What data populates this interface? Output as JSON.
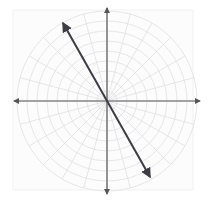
{
  "figure": {
    "width": 208,
    "height": 202,
    "background_color": "#ffffff"
  },
  "chart_data": {
    "type": "scatter",
    "title": "",
    "subtitle": "",
    "xlabel": "",
    "ylabel": "",
    "coordinate_system": "polar",
    "grid": true,
    "legend": false,
    "legend_position": "none",
    "origin": {
      "x": 107,
      "y": 101
    },
    "panel": {
      "x": 13,
      "y": 10,
      "width": 180,
      "height": 180,
      "fill_color": "#fcfcfc",
      "border_color": "#f2f2f2"
    },
    "polar_grid": {
      "circle_color": "#e3e3e6",
      "spoke_color": "#e3e3e6",
      "circle_radii": [
        10,
        20,
        30,
        40,
        50,
        60,
        70,
        80,
        90
      ],
      "radial_spoke_step_degrees": 15,
      "radial_spoke_count": 24,
      "max_radius": 90
    },
    "axes": {
      "color": "#555555",
      "stroke_width": 1.2,
      "x_axis": {
        "x1": 14,
        "y1": 101,
        "x2": 200,
        "y2": 101,
        "arrow_both_ends": true
      },
      "y_axis": {
        "x1": 107,
        "y1": 8,
        "x2": 107,
        "y2": 194,
        "arrow_both_ends": true
      },
      "xlim": [
        -93,
        93
      ],
      "ylim": [
        -93,
        93
      ],
      "tick_labels_x": [],
      "tick_labels_y": []
    },
    "series": [
      {
        "name": "line-through-origin",
        "type": "line",
        "color": "#3d3d46",
        "stroke_width": 2.0,
        "arrow_both_ends": true,
        "points": [
          {
            "x": 63,
            "y": 23
          },
          {
            "x": 150,
            "y": 177
          }
        ],
        "slope_degrees": -60.5,
        "passes_through_origin": true
      }
    ],
    "annotations": []
  }
}
